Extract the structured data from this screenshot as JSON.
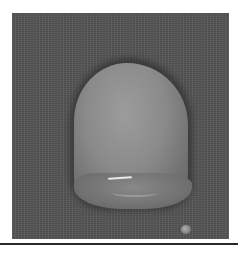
{
  "image": {
    "description": "Grayscale photograph of a viscous gel-like droplet on a textured dark surface, with a small separate droplet at lower right",
    "background_color": "#555555",
    "object_color": "#8a8a8a",
    "rule_color": "#2a2a2a"
  }
}
